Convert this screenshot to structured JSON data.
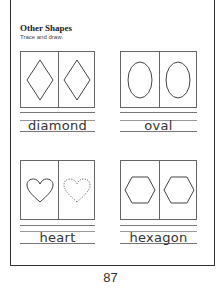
{
  "worksheet": {
    "title": "Other Shapes",
    "instruction": "Trace and draw.",
    "page_number": "87",
    "shapes": [
      {
        "name": "diamond",
        "icon": "diamond-icon",
        "trace_style": "solid"
      },
      {
        "name": "oval",
        "icon": "oval-icon",
        "trace_style": "solid"
      },
      {
        "name": "heart",
        "icon": "heart-icon",
        "trace_style": "dotted"
      },
      {
        "name": "hexagon",
        "icon": "hexagon-icon",
        "trace_style": "solid"
      }
    ]
  }
}
